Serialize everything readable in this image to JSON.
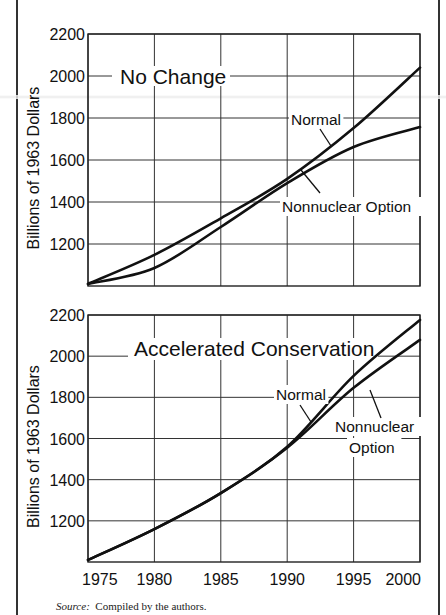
{
  "figure": {
    "source_label": "Source:",
    "source_text": "Compiled by the authors."
  },
  "chart_data": [
    {
      "type": "line",
      "title": "No Change",
      "xlabel": "",
      "ylabel": "Billions of 1963 Dollars",
      "xlim": [
        1975,
        2000
      ],
      "ylim": [
        1000,
        2200
      ],
      "x_ticks": [
        1975,
        1980,
        1985,
        1990,
        1995,
        2000
      ],
      "x_tick_labels_shown": false,
      "y_ticks": [
        1200,
        1400,
        1600,
        1800,
        2000,
        2200
      ],
      "y_tick_labels": [
        "1200",
        "1400",
        "1600",
        "1800",
        "2000",
        "2200"
      ],
      "grid": true,
      "legend": "inline annotations with leader lines",
      "x": [
        1975,
        1980,
        1985,
        1990,
        1995,
        2000
      ],
      "series": [
        {
          "name": "Normal",
          "values": [
            1010,
            1148,
            1322,
            1510,
            1752,
            2040
          ]
        },
        {
          "name": "Nonnuclear Option",
          "values": [
            1010,
            1086,
            1281,
            1490,
            1662,
            1757
          ]
        }
      ],
      "annotations": [
        {
          "text": "Normal",
          "x": 291,
          "y": 125,
          "leader": [
            [
              320,
              129
            ],
            [
              331,
              146
            ]
          ]
        },
        {
          "text": "Nonnuclear Option",
          "x": 282,
          "y": 212,
          "leader": [
            [
              320,
              193
            ],
            [
              301,
              170
            ]
          ]
        }
      ]
    },
    {
      "type": "line",
      "title": "Accelerated Conservation",
      "xlabel": "",
      "ylabel": "Billions of 1963 Dollars",
      "xlim": [
        1975,
        2000
      ],
      "ylim": [
        1000,
        2200
      ],
      "x_ticks": [
        1975,
        1980,
        1985,
        1990,
        1995,
        2000
      ],
      "x_tick_labels": [
        "1975",
        "1980",
        "1985",
        "1990",
        "1995",
        "2000"
      ],
      "y_ticks": [
        1200,
        1400,
        1600,
        1800,
        2000,
        2200
      ],
      "y_tick_labels": [
        "1200",
        "1400",
        "1600",
        "1800",
        "2000",
        "2200"
      ],
      "grid": true,
      "legend": "inline annotations with leader lines",
      "x": [
        1975,
        1980,
        1985,
        1990,
        1995,
        2000
      ],
      "series": [
        {
          "name": "Normal",
          "values": [
            1010,
            1160,
            1335,
            1560,
            1904,
            2176
          ]
        },
        {
          "name": "Nonnuclear Option",
          "values": [
            1010,
            1160,
            1335,
            1555,
            1846,
            2079
          ]
        }
      ],
      "annotations": [
        {
          "text": "Normal",
          "x": 276,
          "y": 400,
          "leader": [
            [
              300,
              405
            ],
            [
              311,
              422
            ]
          ]
        },
        {
          "text": "Nonnuclear",
          "x": 335,
          "y": 432,
          "leader": [
            [
              381,
              418
            ],
            [
              370,
              390
            ]
          ]
        },
        {
          "text": "Option",
          "x": 349,
          "y": 453,
          "leader": null
        }
      ]
    }
  ]
}
